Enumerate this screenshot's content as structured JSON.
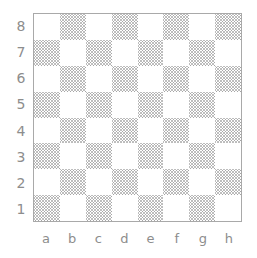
{
  "figure": {
    "kind": "chessboard-coordinate-diagram",
    "background_color": "#ffffff"
  },
  "board": {
    "files": [
      "a",
      "b",
      "c",
      "d",
      "e",
      "f",
      "g",
      "h"
    ],
    "ranks": [
      "8",
      "7",
      "6",
      "5",
      "4",
      "3",
      "2",
      "1"
    ],
    "size": 8,
    "border_color": "#a9a9a9",
    "light_square_color": "#ffffff",
    "dark_square_fill": "hatched-grey",
    "dark_square_color": "#969696",
    "label_color": "#8d8d8d",
    "top_left_square": "a8",
    "top_left_square_shade": "light",
    "squares": [
      [
        "light",
        "dark",
        "light",
        "dark",
        "light",
        "dark",
        "light",
        "dark"
      ],
      [
        "dark",
        "light",
        "dark",
        "light",
        "dark",
        "light",
        "dark",
        "light"
      ],
      [
        "light",
        "dark",
        "light",
        "dark",
        "light",
        "dark",
        "light",
        "dark"
      ],
      [
        "dark",
        "light",
        "dark",
        "light",
        "dark",
        "light",
        "dark",
        "light"
      ],
      [
        "light",
        "dark",
        "light",
        "dark",
        "light",
        "dark",
        "light",
        "dark"
      ],
      [
        "dark",
        "light",
        "dark",
        "light",
        "dark",
        "light",
        "dark",
        "light"
      ],
      [
        "light",
        "dark",
        "light",
        "dark",
        "light",
        "dark",
        "light",
        "dark"
      ],
      [
        "dark",
        "light",
        "dark",
        "light",
        "dark",
        "light",
        "dark",
        "light"
      ]
    ]
  }
}
